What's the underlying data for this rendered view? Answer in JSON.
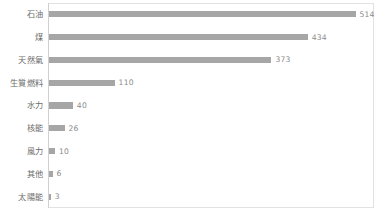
{
  "chart_data": {
    "type": "bar",
    "orientation": "horizontal",
    "title": "",
    "subtitle": "",
    "xlabel": "",
    "ylabel": "",
    "categories": [
      "石油",
      "煤",
      "天然氣",
      "生質燃料",
      "水力",
      "核能",
      "風力",
      "其他",
      "太陽能"
    ],
    "values": [
      514,
      434,
      373,
      110,
      40,
      26,
      10,
      6,
      3
    ],
    "value_labels": [
      "514",
      "434",
      "373",
      "110",
      "40",
      "26",
      "10",
      "6",
      "3"
    ],
    "xlim": [
      0,
      545
    ],
    "grid": false,
    "legend": null,
    "legend_position": "none",
    "bar_color": "#a6a6a6",
    "label_color": "#6b6b6b",
    "value_color": "#8a8a8a",
    "frame_color": "#e2e2e2",
    "axis_color": "#d0d0d0",
    "background": "#ffffff",
    "xticks": [],
    "xtick_labels": []
  }
}
